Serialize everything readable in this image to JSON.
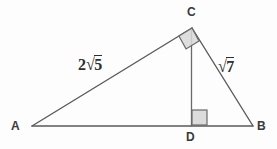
{
  "figure": {
    "type": "geometry-diagram",
    "background_color": "#fdfdfd",
    "stroke_color": "#5a5a5a",
    "marker_fill_color": "#d8d8d8",
    "label_color": "#3a3a3a"
  },
  "points": {
    "A": {
      "label": "A",
      "x": 32,
      "y": 126,
      "label_x": 11,
      "label_y": 120
    },
    "B": {
      "label": "B",
      "x": 253,
      "y": 126,
      "label_x": 257,
      "label_y": 120
    },
    "C": {
      "label": "C",
      "x": 192,
      "y": 28,
      "label_x": 187,
      "label_y": 6
    },
    "D": {
      "label": "D",
      "x": 191,
      "y": 126,
      "label_x": 186,
      "label_y": 131
    }
  },
  "segments": [
    {
      "name": "AC",
      "from": "A",
      "to": "C"
    },
    {
      "name": "CB",
      "from": "C",
      "to": "B"
    },
    {
      "name": "AB",
      "from": "A",
      "to": "B"
    },
    {
      "name": "CD",
      "from": "C",
      "to": "D"
    }
  ],
  "right_angles": [
    {
      "at": "C",
      "between": [
        "CA",
        "CB"
      ],
      "style": "filled-square-rotated"
    },
    {
      "at": "D",
      "between": [
        "DC",
        "DB"
      ],
      "style": "filled-square"
    }
  ],
  "side_labels": {
    "AC": {
      "text": "2√5",
      "coefficient": "2",
      "radicand": "5",
      "x": 78,
      "y": 55
    },
    "CB": {
      "text": "√7",
      "coefficient": "",
      "radicand": "7",
      "x": 218,
      "y": 57
    }
  }
}
